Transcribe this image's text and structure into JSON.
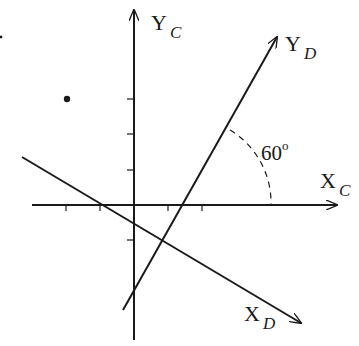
{
  "diagram": {
    "type": "coordinate-frame-rotation",
    "frames": [
      {
        "name": "C",
        "x_label": "X",
        "x_sub": "C",
        "y_label": "Y",
        "y_sub": "C"
      },
      {
        "name": "D",
        "x_label": "X",
        "x_sub": "D",
        "y_label": "Y",
        "y_sub": "D"
      }
    ],
    "angle_label": "60",
    "angle_unit": "o",
    "colors": {
      "stroke": "#1a1a1a",
      "background": "#ffffff"
    },
    "geometry": {
      "origin_C": [
        134,
        205
      ],
      "xc_axis": {
        "x1": 32,
        "y1": 205,
        "x2": 337,
        "y2": 205
      },
      "yc_axis": {
        "x1": 134,
        "y1": 340,
        "x2": 134,
        "y2": 10
      },
      "yd_axis": {
        "x1": 123,
        "y1": 310,
        "x2": 277,
        "y2": 37
      },
      "xd_axis": {
        "x1": 22,
        "y1": 157,
        "x2": 301,
        "y2": 323
      },
      "x_ticks": [
        66,
        100,
        168,
        202
      ],
      "y_ticks": [
        99,
        134,
        170,
        240
      ],
      "point": [
        67,
        99
      ],
      "stray_mark": [
        1,
        37
      ]
    }
  }
}
